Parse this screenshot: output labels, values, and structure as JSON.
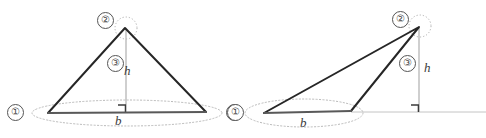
{
  "figure": {
    "type": "geometry-diagram",
    "canvas": {
      "width": 486,
      "height": 138,
      "background": "#ffffff"
    },
    "colors": {
      "triangle_stroke": "#262626",
      "base_stroke": "#555555",
      "height_stroke": "#b0b0b0",
      "ellipse_stroke": "#b9b9b9",
      "ground_stroke": "#c4c4c4",
      "marker_stroke": "#555555",
      "text": "#3a3a3a"
    },
    "markers": {
      "one": "①",
      "two": "②",
      "three": "③"
    },
    "labels": {
      "base": "b",
      "height": "h"
    },
    "diagrams": [
      {
        "name": "acute-triangle",
        "apex": {
          "x": 125,
          "y": 28
        },
        "base_left": {
          "x": 48,
          "y": 113
        },
        "base_right": {
          "x": 206,
          "y": 112
        },
        "foot": {
          "x": 126,
          "y": 112
        },
        "ellipse": {
          "cx": 127,
          "cy": 113,
          "rx": 95,
          "ry": 13
        },
        "apex_circle": {
          "cx": 126,
          "cy": 28,
          "r": 11
        },
        "marker_one_left": {
          "x": 7,
          "y": 104,
          "value": "①"
        },
        "marker_one_right": {
          "x": 226,
          "y": 104,
          "value": "①"
        },
        "marker_two": {
          "x": 97,
          "y": 12,
          "value": "②"
        },
        "marker_three": {
          "x": 107,
          "y": 55,
          "value": "③"
        },
        "base_label": {
          "x": 115,
          "y": 114,
          "text": "b"
        },
        "height_label": {
          "x": 124,
          "y": 64,
          "text": "h"
        }
      },
      {
        "name": "obtuse-triangle",
        "apex": {
          "x": 419,
          "y": 27
        },
        "base_left": {
          "x": 264,
          "y": 113
        },
        "base_right": {
          "x": 351,
          "y": 111
        },
        "foot": {
          "x": 419,
          "y": 112
        },
        "ellipse": {
          "cx": 304,
          "cy": 113,
          "rx": 59,
          "ry": 14
        },
        "apex_circle": {
          "cx": 420,
          "cy": 26,
          "r": 11
        },
        "ground_line": {
          "x1": 351,
          "y1": 112,
          "x2": 486,
          "y2": 112
        },
        "marker_one": {
          "x": 227,
          "y": 104,
          "value": "①"
        },
        "marker_two": {
          "x": 392,
          "y": 11,
          "value": "②"
        },
        "marker_three": {
          "x": 399,
          "y": 55,
          "value": "③"
        },
        "base_label": {
          "x": 300,
          "y": 116,
          "text": "b"
        },
        "height_label": {
          "x": 424,
          "y": 61,
          "text": "h"
        }
      }
    ]
  }
}
